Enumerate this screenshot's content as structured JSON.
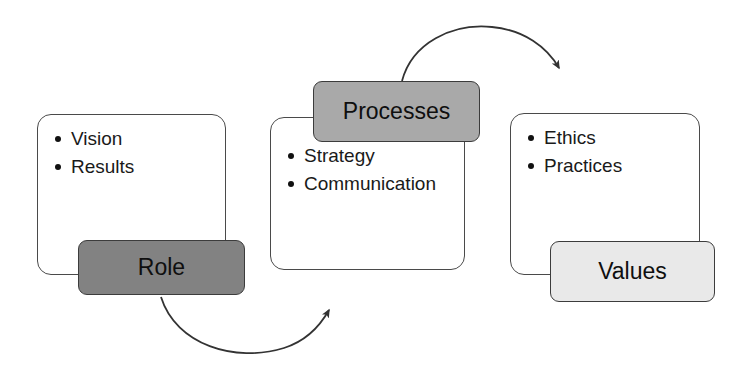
{
  "diagram": {
    "background_color": "#ffffff",
    "colors": {
      "card_border": "#4a4a4a",
      "tag_border": "#3c3c3c",
      "tag_dark": "#828282",
      "tag_mid": "#a9a9a9",
      "tag_light": "#e9e9e9",
      "text": "#0f0f0f",
      "arrow": "#333333"
    },
    "nodes": [
      {
        "id": "role",
        "tag_label": "Role",
        "tag_fill": "dark",
        "items": [
          "Vision",
          "Results"
        ]
      },
      {
        "id": "processes",
        "tag_label": "Processes",
        "tag_fill": "mid",
        "items": [
          "Strategy",
          "Communication"
        ]
      },
      {
        "id": "values",
        "tag_label": "Values",
        "tag_fill": "light",
        "items": [
          "Ethics",
          "Practices"
        ]
      }
    ],
    "arrows": [
      {
        "id": "role-to-processes",
        "from": "role",
        "to": "processes",
        "direction": "right",
        "style": "curved-arc-below"
      },
      {
        "id": "processes-to-values",
        "from": "processes",
        "to": "values",
        "direction": "right",
        "style": "curved-arc-above"
      }
    ]
  }
}
